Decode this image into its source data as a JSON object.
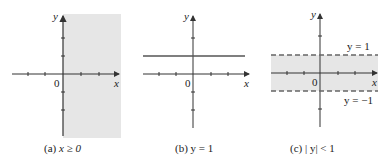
{
  "figure": {
    "panels": [
      {
        "id": "a",
        "caption": "(a) x ≥ 0",
        "caption_prefix": "(a) ",
        "caption_math": "x ≥ 0",
        "region": "half-plane x >= 0 shaded",
        "axis_x_label": "x",
        "axis_y_label": "y",
        "origin_label": "0"
      },
      {
        "id": "b",
        "caption": "(b) y = 1",
        "caption_prefix": "(b) ",
        "caption_math": "y = 1",
        "region": "horizontal line y = 1",
        "axis_x_label": "x",
        "axis_y_label": "y",
        "origin_label": "0"
      },
      {
        "id": "c",
        "caption": "(c) |y| < 1",
        "caption_prefix": "(c) ",
        "caption_math": "| y| < 1",
        "region": "strip -1 < y < 1 shaded with dashed boundaries",
        "axis_x_label": "x",
        "axis_y_label": "y",
        "origin_label": "0",
        "upper_boundary_label": "y = 1",
        "lower_boundary_label": "y = −1"
      }
    ],
    "colors": {
      "shade": "#e6e6e6",
      "axis": "#333333",
      "line": "#555555",
      "dash": "#666666"
    }
  }
}
